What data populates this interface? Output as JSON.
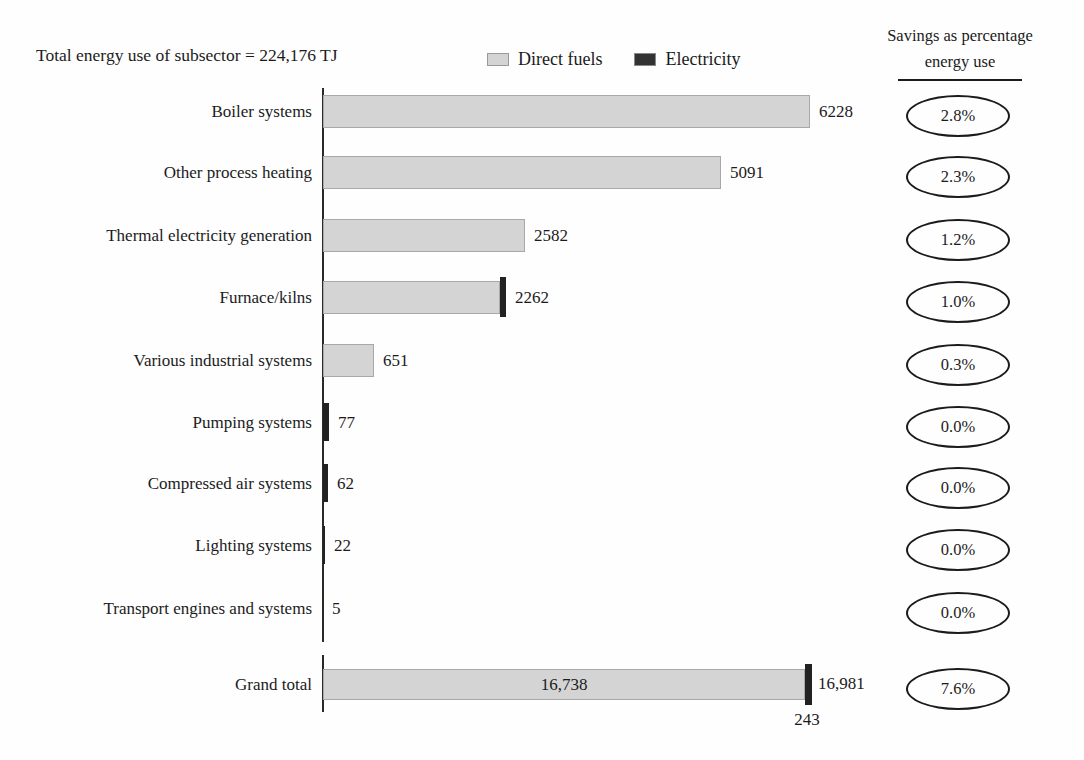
{
  "chart_data": {
    "type": "bar",
    "orientation": "horizontal",
    "title": "Total energy use of subsector = 224,176 TJ",
    "legend": [
      {
        "label": "Direct fuels",
        "color": "#d4d4d4"
      },
      {
        "label": "Electricity",
        "color": "#222222"
      }
    ],
    "savings_header": {
      "line1": "Savings as percentage",
      "line2": "energy use"
    },
    "colors": {
      "direct_fuels": "#d4d4d4",
      "electricity": "#222222",
      "text": "#1b1b1b"
    },
    "unit": "TJ",
    "rows": [
      {
        "label": "Boiler systems",
        "value": 6228,
        "value_label": "6228",
        "series": "direct",
        "electricity_cap": false,
        "savings": "2.8%"
      },
      {
        "label": "Other process heating",
        "value": 5091,
        "value_label": "5091",
        "series": "direct",
        "electricity_cap": false,
        "savings": "2.3%"
      },
      {
        "label": "Thermal electricity generation",
        "value": 2582,
        "value_label": "2582",
        "series": "direct",
        "electricity_cap": false,
        "savings": "1.2%"
      },
      {
        "label": "Furnace/kilns",
        "value": 2262,
        "value_label": "2262",
        "series": "direct",
        "electricity_cap": true,
        "savings": "1.0%"
      },
      {
        "label": "Various industrial systems",
        "value": 651,
        "value_label": "651",
        "series": "direct",
        "electricity_cap": false,
        "savings": "0.3%"
      },
      {
        "label": "Pumping systems",
        "value": 77,
        "value_label": "77",
        "series": "electricity",
        "electricity_cap": false,
        "savings": "0.0%"
      },
      {
        "label": "Compressed air systems",
        "value": 62,
        "value_label": "62",
        "series": "electricity",
        "electricity_cap": false,
        "savings": "0.0%"
      },
      {
        "label": "Lighting systems",
        "value": 22,
        "value_label": "22",
        "series": "electricity",
        "electricity_cap": false,
        "savings": "0.0%"
      },
      {
        "label": "Transport engines and systems",
        "value": 5,
        "value_label": "5",
        "series": "electricity",
        "electricity_cap": false,
        "savings": "0.0%"
      }
    ],
    "grand_total": {
      "label": "Grand total",
      "direct_value": 16738,
      "direct_label": "16,738",
      "electricity_value": 243,
      "electricity_label": "243",
      "total_value": 16981,
      "total_label": "16,981",
      "savings": "7.6%"
    }
  }
}
